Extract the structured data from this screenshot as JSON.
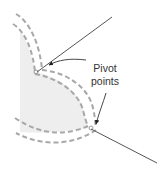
{
  "diagram": {
    "labels": {
      "line1": "Pivot",
      "line2": "points"
    },
    "elements": {
      "fill_region": "shaded-area",
      "offset_paths": 2,
      "pivot_points": 2,
      "tangent_lines": 2,
      "annotation_arrows": 2
    },
    "colors": {
      "background": "#ffffff",
      "fill": "#ededed",
      "dashed_path": "#a8a8a8",
      "line": "#555555",
      "arrow": "#333333",
      "text": "#333333"
    }
  }
}
